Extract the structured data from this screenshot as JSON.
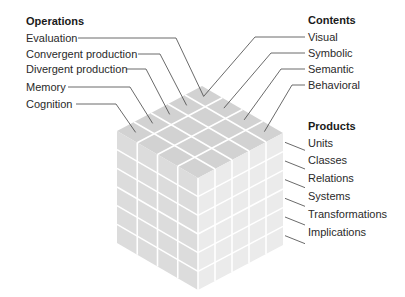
{
  "operations": {
    "heading": "Operations",
    "items": [
      "Evaluation",
      "Convergent production",
      "Divergent production",
      "Memory",
      "Cognition"
    ]
  },
  "contents": {
    "heading": "Contents",
    "items": [
      "Visual",
      "Symbolic",
      "Semantic",
      "Behavioral"
    ]
  },
  "products": {
    "heading": "Products",
    "items": [
      "Units",
      "Classes",
      "Relations",
      "Systems",
      "Transformations",
      "Implications"
    ]
  },
  "colors": {
    "top_face": "#d2d2d2",
    "left_face": "#dcdcdc",
    "right_face": "#ebebeb",
    "grid": "#ffffff",
    "leader": "#444444"
  }
}
